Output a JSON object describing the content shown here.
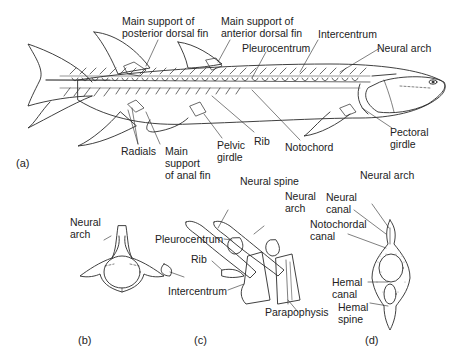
{
  "figure": {
    "panels": {
      "a": "(a)",
      "b": "(b)",
      "c": "(c)",
      "d": "(d)"
    },
    "a_labels": {
      "posterior_dorsal_1": "Main support of",
      "posterior_dorsal_2": "posterior dorsal fin",
      "anterior_dorsal_1": "Main support of",
      "anterior_dorsal_2": "anterior dorsal fin",
      "intercentrum": "Intercentrum",
      "pleurocentrum": "Pleurocentrum",
      "neural_arch": "Neural arch",
      "radials": "Radials",
      "anal_1": "Main",
      "anal_2": "support",
      "anal_3": "of anal fin",
      "pelvic_1": "Pelvic",
      "pelvic_2": "girdle",
      "rib": "Rib",
      "notochord": "Notochord",
      "pectoral_1": "Pectoral",
      "pectoral_2": "girdle"
    },
    "b_labels": {
      "neural_arch_1": "Neural",
      "neural_arch_2": "arch"
    },
    "c_labels": {
      "neural_spine": "Neural spine",
      "neural_arch_1": "Neural",
      "neural_arch_2": "arch",
      "pleurocentrum": "Pleurocentrum",
      "rib": "Rib",
      "intercentrum": "Intercentrum",
      "parapophysis": "Parapophysis"
    },
    "d_labels": {
      "neural_arch": "Neural arch",
      "neural_canal_1": "Neural",
      "neural_canal_2": "canal",
      "notochordal_1": "Notochordal",
      "notochordal_2": "canal",
      "hemal_canal_1": "Hemal",
      "hemal_canal_2": "canal",
      "hemal_spine_1": "Hemal",
      "hemal_spine_2": "spine"
    },
    "colors": {
      "line": "#2a2a2a",
      "stipple": "#9a9a9a",
      "background": "#ffffff"
    }
  }
}
